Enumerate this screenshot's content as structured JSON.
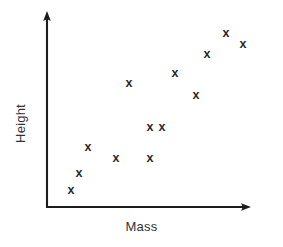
{
  "chart_data": {
    "type": "scatter",
    "title": "",
    "xlabel": "Mass",
    "ylabel": "Height",
    "grid": false,
    "legend": false,
    "axis_style": "arrow-tipped L-shaped axes, no tick marks, no tick labels",
    "marker": "x",
    "marker_color": "#2a2a2a",
    "axis_color": "#1c1c1c",
    "background_color": "#ffffff",
    "xlim": [
      0,
      100
    ],
    "ylim": [
      0,
      100
    ],
    "n_points": 13,
    "relationship": "positive correlation",
    "x": [
      12,
      16,
      20,
      34,
      40,
      50,
      50,
      63,
      73,
      79,
      88,
      96,
      62
    ],
    "y": [
      9,
      18,
      31,
      25,
      64,
      25,
      41,
      69,
      58,
      79,
      89,
      84,
      41
    ],
    "points": [
      {
        "x": 12,
        "y": 9
      },
      {
        "x": 16,
        "y": 18
      },
      {
        "x": 20,
        "y": 31
      },
      {
        "x": 34,
        "y": 25
      },
      {
        "x": 40,
        "y": 64
      },
      {
        "x": 50,
        "y": 25
      },
      {
        "x": 50,
        "y": 41
      },
      {
        "x": 62,
        "y": 41
      },
      {
        "x": 63,
        "y": 69
      },
      {
        "x": 73,
        "y": 58
      },
      {
        "x": 79,
        "y": 79
      },
      {
        "x": 88,
        "y": 89
      },
      {
        "x": 96,
        "y": 84
      }
    ],
    "pixel_points": [
      {
        "px": 71,
        "py": 190
      },
      {
        "px": 79,
        "py": 173
      },
      {
        "px": 88,
        "py": 147
      },
      {
        "px": 116,
        "py": 158
      },
      {
        "px": 129,
        "py": 83
      },
      {
        "px": 150,
        "py": 158
      },
      {
        "px": 150,
        "py": 127
      },
      {
        "px": 175,
        "py": 73
      },
      {
        "px": 196,
        "py": 95
      },
      {
        "px": 207,
        "py": 54
      },
      {
        "px": 226,
        "py": 33
      },
      {
        "px": 243,
        "py": 44
      },
      {
        "px": 162,
        "py": 127
      }
    ],
    "marker_symbol": "x"
  },
  "figure": {
    "xlabel": "Mass",
    "ylabel": "Height"
  }
}
